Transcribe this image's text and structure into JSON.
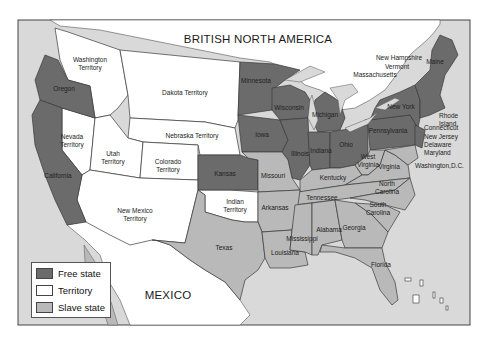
{
  "colors": {
    "free_state": "#6b6b6b",
    "territory": "#ffffff",
    "slave_state": "#b9b9b9",
    "water": "#d9d9d9",
    "border": "#3a3a3a"
  },
  "regions": {
    "british_north_america": "BRITISH NORTH AMERICA",
    "mexico": "MEXICO"
  },
  "legend": {
    "items": [
      {
        "label": "Free state",
        "color": "#6b6b6b"
      },
      {
        "label": "Territory",
        "color": "#ffffff"
      },
      {
        "label": "Slave state",
        "color": "#b9b9b9"
      }
    ]
  },
  "territories": {
    "washington": "Washington\nTerritory",
    "dakota": "Dakota Territory",
    "nebraska": "Nebraska Territory",
    "nevada": "Nevada\nTerritory",
    "utah": "Utah\nTerritory",
    "colorado": "Colorado\nTerritory",
    "new_mexico": "New Mexico\nTerritory",
    "indian": "Indian\nTerritory"
  },
  "free_states": {
    "oregon": "Oregon",
    "california": "California",
    "minnesota": "Minnesota",
    "wisconsin": "Wisconsin",
    "michigan": "Michigan",
    "iowa": "Iowa",
    "illinois": "Illinois",
    "indiana": "Indiana",
    "ohio": "Ohio",
    "kansas": "Kansas",
    "pennsylvania": "Pennsylvania",
    "new_york": "New York",
    "maine": "Maine",
    "new_hampshire": "New Hampshire",
    "vermont": "Vermont",
    "massachusetts": "Massachusetts",
    "rhode_island": "Rhode\nIsland",
    "connecticut": "Connecticut",
    "new_jersey": "New Jersey"
  },
  "slave_states": {
    "missouri": "Missouri",
    "kentucky": "Kentucky",
    "west_virginia": "West\nVirginia",
    "virginia": "Virginia",
    "delaware": "Delaware",
    "maryland": "Maryland",
    "tennessee": "Tennessee",
    "north_carolina": "North\nCarolina",
    "south_carolina": "South\nCarolina",
    "arkansas": "Arkansas",
    "texas": "Texas",
    "louisiana": "Louisiana",
    "mississippi": "Mississippi",
    "alabama": "Alabama",
    "georgia": "Georgia",
    "florida": "Florida"
  },
  "other_labels": {
    "washington_dc": "Washington,D.C."
  }
}
